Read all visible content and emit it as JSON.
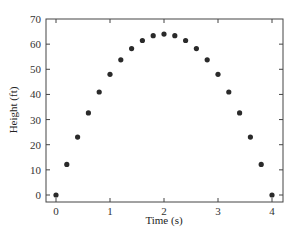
{
  "chart_data": {
    "type": "scatter",
    "title": "",
    "xlabel": "Time (s)",
    "ylabel": "Height (ft)",
    "xlim": [
      -0.3,
      4.2
    ],
    "ylim": [
      -3,
      70
    ],
    "xticks": [
      0,
      1,
      2,
      3,
      4
    ],
    "yticks": [
      0,
      10,
      20,
      30,
      40,
      50,
      60,
      70
    ],
    "grid": false,
    "legend": null,
    "marker_color": "#2a2a2a",
    "series": [
      {
        "name": "Height",
        "x": [
          0,
          0.2,
          0.4,
          0.6,
          0.8,
          1.0,
          1.2,
          1.4,
          1.6,
          1.8,
          2.0,
          2.2,
          2.4,
          2.6,
          2.8,
          3.0,
          3.2,
          3.4,
          3.6,
          3.8,
          4.0
        ],
        "y": [
          0,
          12.16,
          23.04,
          32.64,
          40.96,
          48,
          53.76,
          58.24,
          61.44,
          63.36,
          64,
          63.36,
          61.44,
          58.24,
          53.76,
          48,
          40.96,
          32.64,
          23.04,
          12.16,
          0
        ]
      }
    ]
  }
}
